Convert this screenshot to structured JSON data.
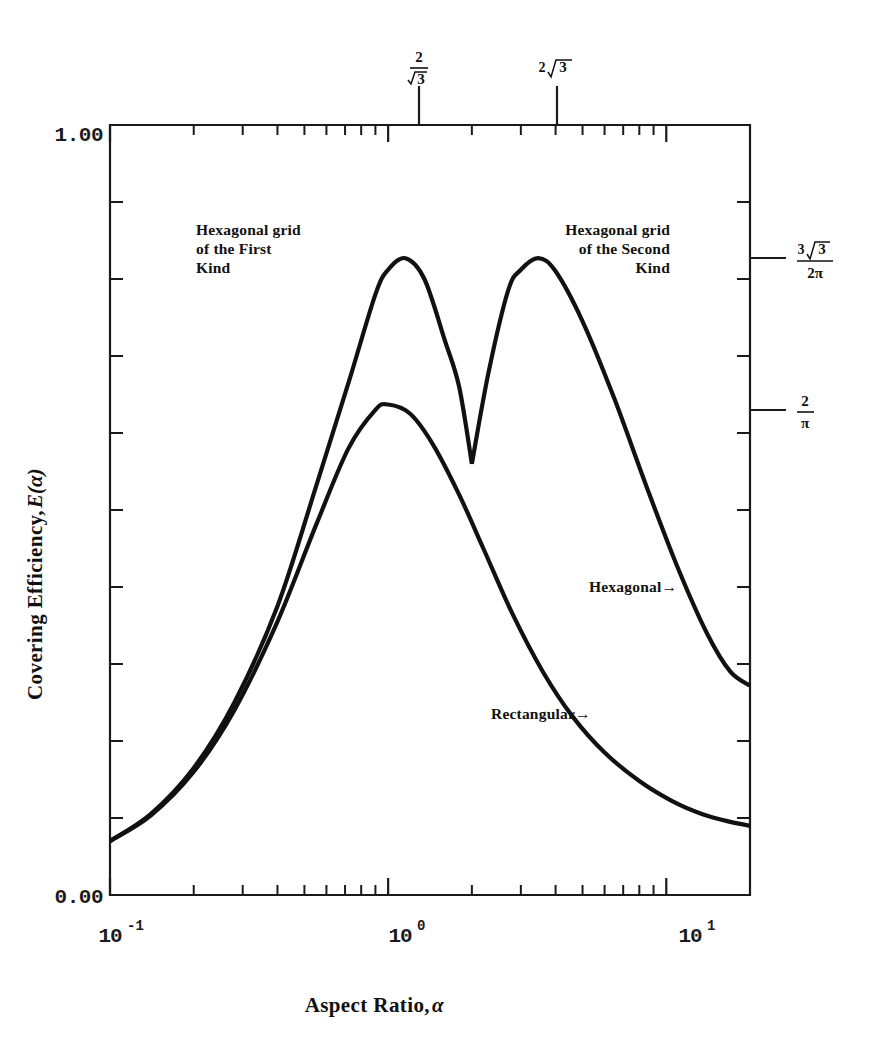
{
  "figure": {
    "background_color": "#ffffff",
    "ink_color": "#111111"
  },
  "axes": {
    "x_title": "Aspect Ratio, ",
    "x_title_symbol": "α",
    "y_title": "Covering Efficiency, ",
    "y_title_symbol": "E(α)",
    "y_label_top": "1.00",
    "y_label_bottom": "0.00",
    "x_label_left_base": "10",
    "x_label_left_exp": "-1",
    "x_label_mid_base": "10",
    "x_label_mid_exp": "0",
    "x_label_right_base": "10",
    "x_label_right_exp": "1"
  },
  "top_markers": [
    {
      "name": "two-over-sqrt3",
      "numerator": "2",
      "denominator_radicand": "3",
      "value": 1.1547
    },
    {
      "name": "two-sqrt3",
      "coefficient": "2",
      "radicand": "3",
      "value": 3.4641
    }
  ],
  "right_markers": [
    {
      "name": "three-sqrt3-over-two-pi",
      "numerator_coefficient": "3",
      "numerator_radicand": "3",
      "denominator": "2π",
      "value": 0.827
    },
    {
      "name": "two-over-pi",
      "numerator": "2",
      "denominator": "π",
      "value": 0.6366
    }
  ],
  "annotations": {
    "hex_first_kind": [
      "Hexagonal grid",
      "of the First",
      "Kind"
    ],
    "hex_second_kind": [
      "Hexagonal grid",
      "of the Second",
      "Kind"
    ],
    "hexagonal_curve": "Hexagonal→",
    "rectangular_curve": "Rectangular→"
  },
  "chart_data": {
    "type": "line",
    "title": "",
    "xlabel": "Aspect Ratio, α",
    "ylabel": "Covering Efficiency, E(α)",
    "xscale": "log",
    "xlim": [
      0.1,
      20
    ],
    "ylim": [
      0.0,
      1.0
    ],
    "grid": false,
    "legend": "inline-annotations",
    "x_ticks_labeled": [
      "10^-1",
      "10^0",
      "10^1"
    ],
    "y_ticks_labeled": [
      "0.00",
      "1.00"
    ],
    "special_x_marks": [
      {
        "label": "2/√3",
        "value": 1.1547
      },
      {
        "label": "2√3",
        "value": 3.4641
      }
    ],
    "special_y_marks": [
      {
        "label": "3√3/(2π)",
        "value": 0.827
      },
      {
        "label": "2/π",
        "value": 0.6366
      }
    ],
    "series": [
      {
        "name": "Hexagonal",
        "note": "Two lobes: hexagonal grid of the first kind peaks at alpha=2/sqrt3 (E=3sqrt3/2pi), cusp minimum at alpha=2 (E~0.637), hexagonal grid of the second kind peaks at alpha=2sqrt3 (E=3sqrt3/2pi)",
        "x": [
          0.1,
          0.14,
          0.2,
          0.28,
          0.4,
          0.55,
          0.72,
          0.9,
          1.0,
          1.1547,
          1.35,
          1.6,
          1.8,
          2.0,
          2.3,
          2.7,
          3.0,
          3.4641,
          4.0,
          5.0,
          6.5,
          8.5,
          11.0,
          14.0,
          17.0,
          20.0
        ],
        "y": [
          0.07,
          0.105,
          0.165,
          0.25,
          0.375,
          0.53,
          0.665,
          0.78,
          0.812,
          0.827,
          0.8,
          0.72,
          0.66,
          0.56,
          0.68,
          0.785,
          0.812,
          0.827,
          0.81,
          0.745,
          0.645,
          0.53,
          0.425,
          0.34,
          0.29,
          0.272
        ]
      },
      {
        "name": "Rectangular",
        "note": "Single lobe peaking at alpha=1 with E=2/pi",
        "x": [
          0.1,
          0.14,
          0.2,
          0.28,
          0.4,
          0.55,
          0.72,
          0.9,
          1.0,
          1.2,
          1.45,
          1.8,
          2.2,
          2.8,
          3.6,
          4.6,
          6.0,
          8.0,
          10.5,
          13.5,
          17.0,
          20.0
        ],
        "y": [
          0.07,
          0.103,
          0.16,
          0.24,
          0.355,
          0.48,
          0.58,
          0.63,
          0.637,
          0.625,
          0.585,
          0.52,
          0.45,
          0.365,
          0.29,
          0.232,
          0.185,
          0.148,
          0.122,
          0.105,
          0.095,
          0.09
        ]
      }
    ]
  }
}
